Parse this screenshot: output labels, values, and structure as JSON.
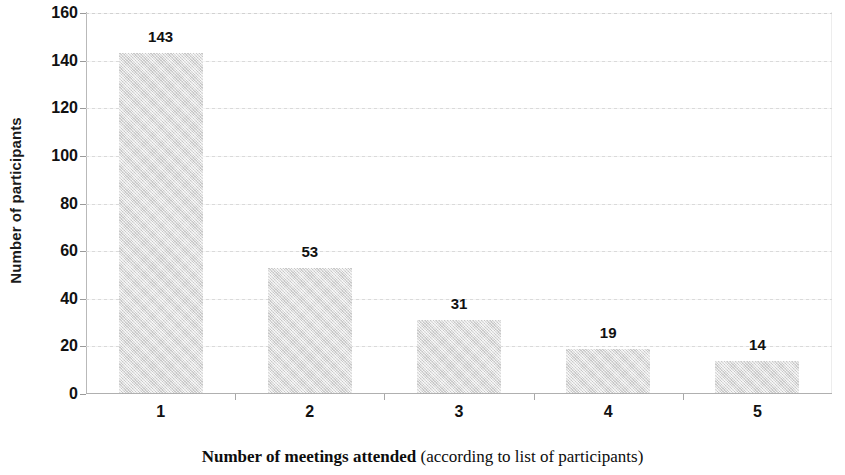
{
  "chart_data": {
    "type": "bar",
    "title": "",
    "subtitle": "",
    "categories": [
      "1",
      "2",
      "3",
      "4",
      "5"
    ],
    "values": [
      143,
      53,
      31,
      19,
      14
    ],
    "data_labels": [
      "143",
      "53",
      "31",
      "19",
      "14"
    ],
    "xlabel_bold": "Number of meetings attended",
    "xlabel_normal": " (according to list of participants)",
    "ylabel": "Number of participants",
    "ylim": [
      0,
      160
    ],
    "ytick_step": 20,
    "yticks": [
      0,
      20,
      40,
      60,
      80,
      100,
      120,
      140,
      160
    ],
    "ytick_labels": [
      "0",
      "20",
      "40",
      "60",
      "80",
      "100",
      "120",
      "140",
      "160"
    ],
    "grid": true,
    "grid_axis": "y",
    "legend": false,
    "legend_position": "none",
    "bar_color": "#dedede",
    "bar_edge_color": "#dedede",
    "axis_color": "#b0b0b0",
    "gridline_color": "#d8d8d8",
    "text_color": "#111111"
  }
}
